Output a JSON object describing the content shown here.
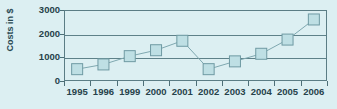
{
  "chart_data": {
    "type": "line",
    "title": "",
    "subtitle": "",
    "xlabel": "",
    "ylabel": "Costs in $",
    "categories": [
      "1995",
      "1996",
      "1999",
      "2000",
      "2001",
      "2002",
      "2003",
      "2004",
      "2005",
      "2006"
    ],
    "values": [
      500,
      700,
      1050,
      1300,
      1700,
      500,
      830,
      1150,
      1750,
      2600
    ],
    "series": [
      {
        "name": "Costs",
        "values": [
          500,
          700,
          1050,
          1300,
          1700,
          500,
          830,
          1150,
          1750,
          2600
        ]
      }
    ],
    "ylim": [
      0,
      3000
    ],
    "y_ticks": [
      0,
      1000,
      2000,
      3000
    ],
    "y_tick_labels": [
      "0",
      "1000",
      "2000",
      "3000"
    ],
    "grid": true,
    "grid_axis": "y",
    "legend": false,
    "legend_position": "none",
    "marker": "square",
    "annotations": []
  },
  "style": {
    "background_color": "#dceff2",
    "axis_color": "#5b7d85",
    "text_color": "#26424a",
    "marker_fill": "#bedfe4",
    "marker_stroke": "#6f9aa3",
    "line_color": "#7fa8b0"
  }
}
